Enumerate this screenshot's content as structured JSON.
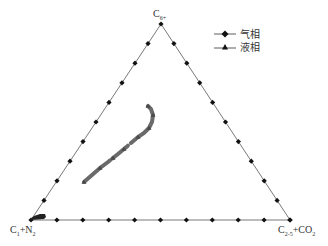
{
  "chart_data": {
    "type": "scatter",
    "subtype": "ternary",
    "title": "",
    "vertices": {
      "top": "C6+",
      "bottom_left": "C1+N2",
      "bottom_right": "C2-5+CO2"
    },
    "axis_ticks_per_edge": 10,
    "legend": [
      {
        "name": "气相",
        "marker": "diamond",
        "label": "气相"
      },
      {
        "name": "液相",
        "marker": "triangle",
        "label": "液相"
      }
    ],
    "series": [
      {
        "name": "气相",
        "description": "gas phase points clustered near C1+N2 vertex",
        "points_ternary": [
          [
            0.97,
            0.02,
            0.01
          ],
          [
            0.95,
            0.03,
            0.02
          ],
          [
            0.93,
            0.04,
            0.03
          ],
          [
            0.92,
            0.05,
            0.03
          ],
          [
            0.9,
            0.06,
            0.04
          ]
        ]
      },
      {
        "name": "液相",
        "description": "liquid phase points forming a curved band in triangle interior",
        "points_ternary": [
          [
            0.55,
            0.15,
            0.3
          ],
          [
            0.5,
            0.18,
            0.32
          ],
          [
            0.45,
            0.2,
            0.35
          ],
          [
            0.4,
            0.23,
            0.37
          ],
          [
            0.35,
            0.25,
            0.4
          ],
          [
            0.3,
            0.27,
            0.43
          ],
          [
            0.26,
            0.28,
            0.46
          ],
          [
            0.24,
            0.28,
            0.48
          ],
          [
            0.22,
            0.3,
            0.48
          ],
          [
            0.2,
            0.35,
            0.45
          ]
        ]
      }
    ],
    "legend_position": "upper right",
    "grid": false
  },
  "labels": {
    "top": "C",
    "top_sub": "6+",
    "bl": "C",
    "bl_sub1": "1",
    "bl_mid": "+N",
    "bl_sub2": "2",
    "br": "C",
    "br_sub1": "2-5",
    "br_mid": "+CO",
    "br_sub2": "2"
  },
  "legend": {
    "gas": "气相",
    "liquid": "液相"
  }
}
